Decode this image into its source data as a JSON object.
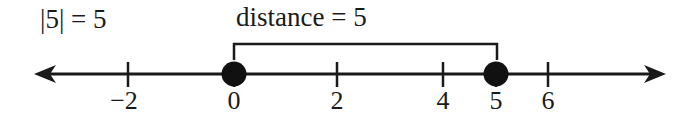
{
  "equation": "|5| = 5",
  "bracket": {
    "label": "distance = 5",
    "from": 0,
    "to": 5
  },
  "number_line": {
    "direction": "both",
    "ticks": [
      {
        "value": -2,
        "label": "−2"
      },
      {
        "value": 0,
        "label": "0"
      },
      {
        "value": 2,
        "label": "2"
      },
      {
        "value": 4,
        "label": "4"
      },
      {
        "value": 5,
        "label": "5"
      },
      {
        "value": 6,
        "label": "6"
      }
    ],
    "points": [
      {
        "value": 0,
        "style": "filled-dot"
      },
      {
        "value": 5,
        "style": "filled-dot"
      }
    ]
  },
  "colors": {
    "ink": "#1a1a1a",
    "background": "#ffffff"
  }
}
